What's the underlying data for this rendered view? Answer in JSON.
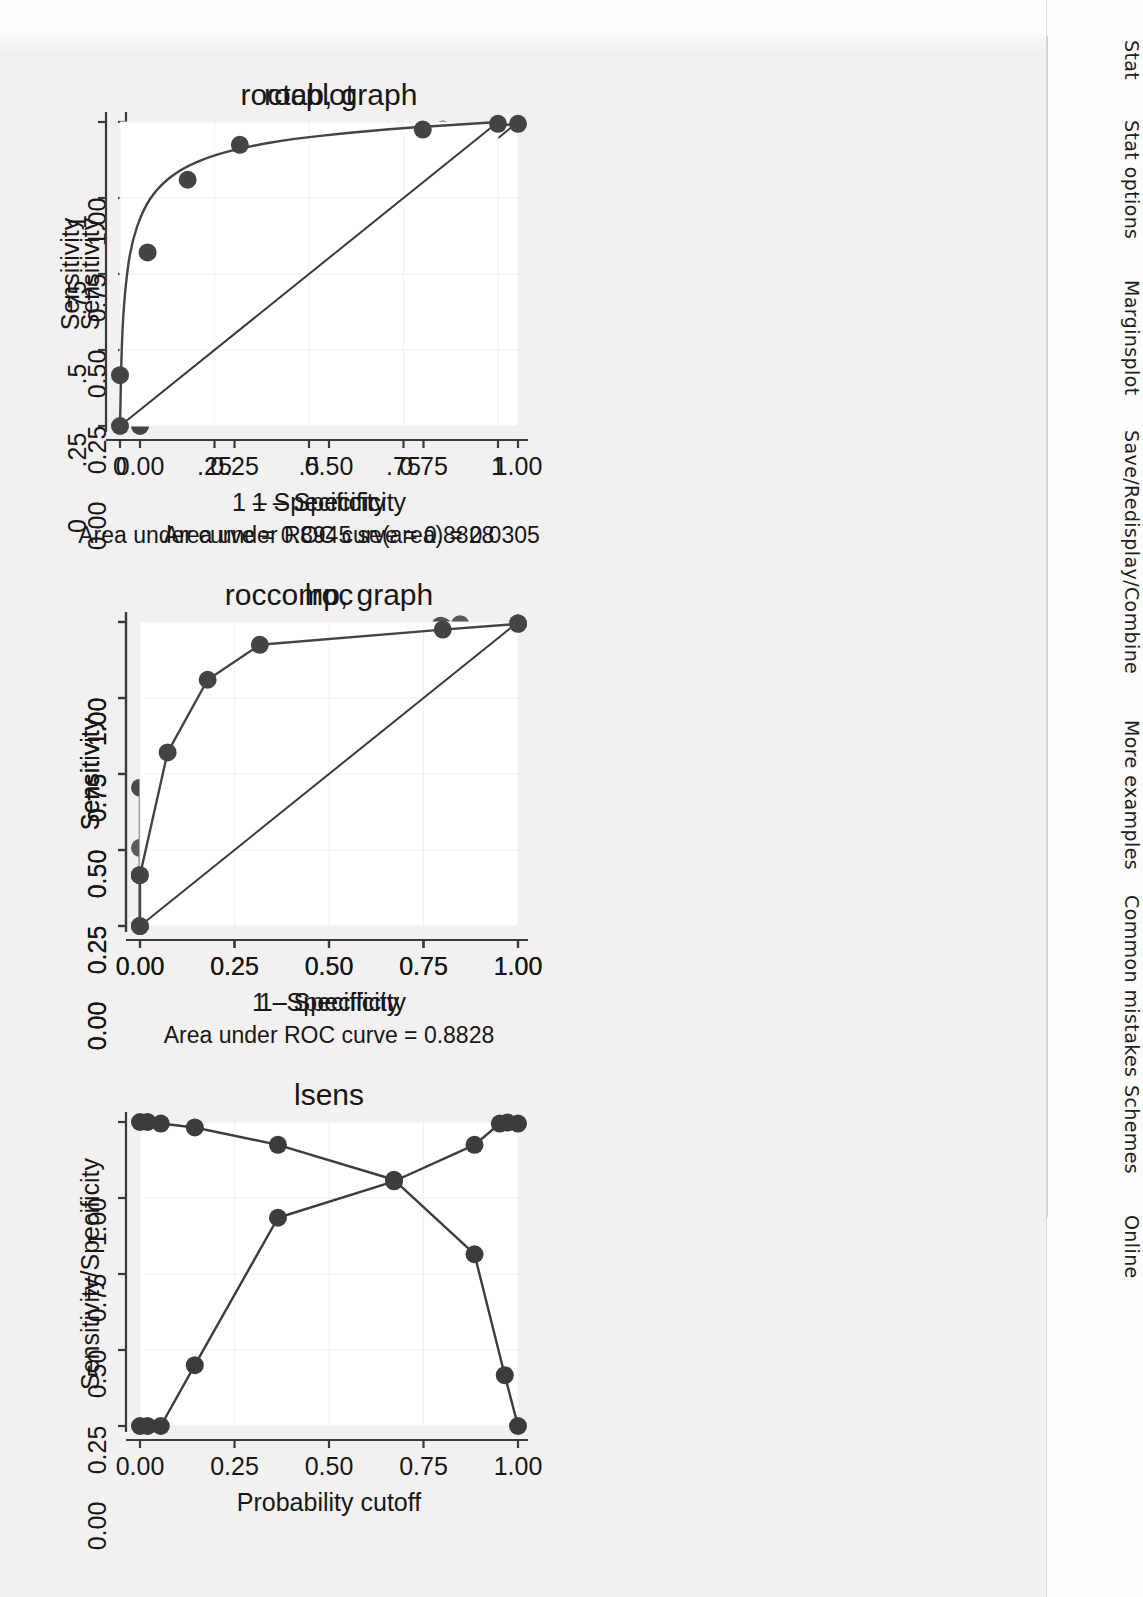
{
  "sidebar": {
    "items": [
      {
        "label": "Stat",
        "top": 40
      },
      {
        "label": "Stat options",
        "top": 120
      },
      {
        "label": "Marginsplot",
        "top": 280
      },
      {
        "label": "Save/Redisplay/Combine",
        "top": 430
      },
      {
        "label": "More examples",
        "top": 720
      },
      {
        "label": "Common mistakes",
        "top": 895
      },
      {
        "label": "Schemes",
        "top": 1085
      },
      {
        "label": "Online",
        "top": 1215
      }
    ]
  },
  "chart_data": [
    {
      "id": "roctab",
      "type": "line",
      "title": "roctab, graph",
      "xlabel": "1 – Specificity",
      "ylabel": "Sensitivity",
      "note": "Area under ROC curve = 0.8828",
      "xlim": [
        0,
        1
      ],
      "ylim": [
        0,
        1
      ],
      "xticks": [
        0,
        0.25,
        0.5,
        0.75,
        1
      ],
      "xticklabels": [
        "0.00",
        "0.25",
        "0.50",
        "0.75",
        "1.00"
      ],
      "yticks": [
        0,
        0.25,
        0.5,
        0.75,
        1
      ],
      "yticklabels": [
        "0.00",
        "0.25",
        "0.50",
        "0.75",
        "1.00"
      ],
      "grid": false,
      "reference_line": [
        [
          0,
          0
        ],
        [
          1,
          1
        ]
      ],
      "series": [
        {
          "name": "ROC curve",
          "markers": true,
          "color": "#444444",
          "x": [
            0.0,
            0.0,
            0.073,
            0.179,
            0.317,
            0.801,
            1.0
          ],
          "y": [
            0.0,
            0.167,
            0.571,
            0.81,
            0.925,
            0.975,
            0.994
          ]
        }
      ]
    },
    {
      "id": "rocplot",
      "type": "line",
      "title": "rocplot",
      "xlabel": "1 – Specificity",
      "ylabel": "Sensitivity",
      "note": "Area under curve = 0.8945   se(area) = 0.0305",
      "xlim": [
        0,
        1
      ],
      "ylim": [
        0,
        1
      ],
      "xticks": [
        0,
        0.25,
        0.5,
        0.75,
        1
      ],
      "xticklabels": [
        "0",
        ".25",
        ".5",
        ".75",
        "1"
      ],
      "yticks": [
        0,
        0.25,
        0.5,
        0.75,
        1
      ],
      "yticklabels": [
        "0",
        ".25",
        ".5",
        ".75",
        "1"
      ],
      "grid": false,
      "reference_line": [
        [
          0,
          0
        ],
        [
          1,
          1
        ]
      ],
      "series": [
        {
          "name": "Smoothed ROC curve",
          "markers": false,
          "smooth": true,
          "color": "#444444",
          "x": [
            0.0,
            0.005,
            0.015,
            0.03,
            0.06,
            0.1,
            0.16,
            0.24,
            0.34,
            0.46,
            0.6,
            0.75,
            0.88,
            1.0
          ],
          "y": [
            0.0,
            0.3,
            0.47,
            0.6,
            0.71,
            0.785,
            0.845,
            0.888,
            0.92,
            0.945,
            0.964,
            0.98,
            0.99,
            1.0
          ]
        },
        {
          "name": "Empirical points",
          "markers": true,
          "line": false,
          "color": "#444444",
          "x": [
            0.0,
            0.0,
            0.073,
            0.179,
            0.317,
            0.801,
            1.0
          ],
          "y": [
            0.0,
            0.167,
            0.571,
            0.81,
            0.925,
            0.975,
            0.994
          ]
        }
      ]
    },
    {
      "id": "roccomp",
      "type": "line",
      "title": "roccomp, graph",
      "xlabel": "1–Specificity",
      "ylabel": "Sensitivity",
      "note": "",
      "xlim": [
        0,
        1
      ],
      "ylim": [
        0,
        1
      ],
      "xticks": [
        0,
        0.25,
        0.5,
        0.75,
        1
      ],
      "xticklabels": [
        "0.00",
        "0.25",
        "0.50",
        "0.75",
        "1.00"
      ],
      "yticks": [
        0,
        0.25,
        0.5,
        0.75,
        1
      ],
      "yticklabels": [
        "0.00",
        "0.25",
        "0.50",
        "0.75",
        "1.00"
      ],
      "grid": false,
      "reference_line": [
        [
          0,
          0
        ],
        [
          1,
          1
        ]
      ],
      "series": [
        {
          "name": "curve 1",
          "markers": true,
          "color": "#4a4a4a",
          "x": [
            0.0,
            0.0,
            0.0,
            0.045,
            0.123,
            0.303,
            0.795,
            1.0
          ],
          "y": [
            0.0,
            0.167,
            0.455,
            0.578,
            0.92,
            0.944,
            0.988,
            0.995
          ]
        },
        {
          "name": "curve 2",
          "markers": true,
          "color": "#5a5a5a",
          "x": [
            0.0,
            0.0,
            0.0,
            0.055,
            0.057,
            0.303,
            0.847,
            1.0
          ],
          "y": [
            0.0,
            0.167,
            0.257,
            0.578,
            0.812,
            0.944,
            0.993,
            0.995
          ]
        },
        {
          "name": "curve 3",
          "markers": true,
          "color": "#555555",
          "x": [
            0.0,
            0.0,
            0.073,
            0.179,
            0.317,
            0.481,
            0.801,
            1.0
          ],
          "y": [
            0.0,
            0.167,
            0.571,
            0.81,
            0.925,
            0.94,
            0.985,
            0.995
          ]
        }
      ]
    },
    {
      "id": "lroc",
      "type": "line",
      "title": "lroc",
      "xlabel": "1 – Specificity",
      "ylabel": "Sensitivity",
      "note": "Area under ROC curve = 0.8828",
      "xlim": [
        0,
        1
      ],
      "ylim": [
        0,
        1
      ],
      "xticks": [
        0,
        0.25,
        0.5,
        0.75,
        1
      ],
      "xticklabels": [
        "0.00",
        "0.25",
        "0.50",
        "0.75",
        "1.00"
      ],
      "yticks": [
        0,
        0.25,
        0.5,
        0.75,
        1
      ],
      "yticklabels": [
        "0.00",
        "0.25",
        "0.50",
        "0.75",
        "1.00"
      ],
      "grid": false,
      "reference_line": [
        [
          0,
          0
        ],
        [
          1,
          1
        ]
      ],
      "series": [
        {
          "name": "ROC curve",
          "markers": true,
          "color": "#444444",
          "x": [
            0.0,
            0.0,
            0.073,
            0.179,
            0.317,
            0.801,
            1.0
          ],
          "y": [
            0.0,
            0.167,
            0.571,
            0.81,
            0.925,
            0.975,
            0.994
          ]
        }
      ]
    },
    {
      "id": "lsens",
      "type": "line",
      "title": "lsens",
      "xlabel": "Probability cutoff",
      "ylabel": "Sensitivity/Specificity",
      "note": "",
      "xlim": [
        0,
        1
      ],
      "ylim": [
        0,
        1
      ],
      "xticks": [
        0,
        0.25,
        0.5,
        0.75,
        1
      ],
      "xticklabels": [
        "0.00",
        "0.25",
        "0.50",
        "0.75",
        "1.00"
      ],
      "yticks": [
        0,
        0.25,
        0.5,
        0.75,
        1
      ],
      "yticklabels": [
        "0.00",
        "0.25",
        "0.50",
        "0.75",
        "1.00"
      ],
      "grid": false,
      "series": [
        {
          "name": "Sensitivity",
          "markers": true,
          "color": "#3c3c3c",
          "x": [
            0.0,
            0.02,
            0.055,
            0.145,
            0.365,
            0.672,
            0.885,
            0.965,
            1.0
          ],
          "y": [
            1.0,
            1.0,
            0.995,
            0.982,
            0.925,
            0.81,
            0.565,
            0.167,
            0.0
          ]
        },
        {
          "name": "Specificity",
          "markers": true,
          "color": "#3c3c3c",
          "x": [
            0.0,
            0.02,
            0.055,
            0.145,
            0.365,
            0.672,
            0.885,
            0.952,
            0.972,
            1.0
          ],
          "y": [
            0.0,
            0.0,
            0.0,
            0.2,
            0.685,
            0.805,
            0.925,
            0.995,
            0.998,
            0.995
          ]
        }
      ]
    }
  ],
  "colors": {
    "page_background": "#f2f1ef",
    "plot_background": "#ffffff",
    "axis": "#3a3a3a",
    "marker": "#444444",
    "text": "#171717"
  }
}
